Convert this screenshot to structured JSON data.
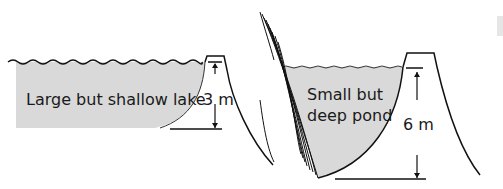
{
  "diagram": {
    "lake": {
      "label": "Large but shallow lake",
      "depth": "3 m"
    },
    "pond": {
      "label_line1": "Small but",
      "label_line2": "deep pond",
      "depth": "6 m"
    },
    "colors": {
      "water": "#d9d9d9",
      "line": "#111111",
      "background": "#ffffff"
    }
  }
}
